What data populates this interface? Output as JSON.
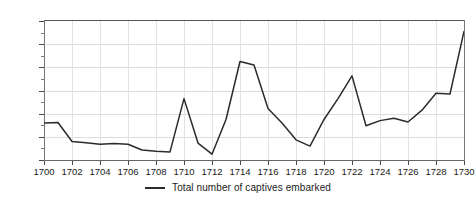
{
  "chart_data": {
    "type": "line",
    "title": "",
    "xlabel": "",
    "ylabel": "",
    "xlim": [
      1700,
      1730
    ],
    "ylim": [
      0,
      6000
    ],
    "grid": true,
    "legend_position": "bottom-center",
    "x": [
      1700,
      1701,
      1702,
      1703,
      1704,
      1705,
      1706,
      1707,
      1708,
      1709,
      1710,
      1711,
      1712,
      1713,
      1714,
      1715,
      1716,
      1717,
      1718,
      1719,
      1720,
      1721,
      1722,
      1723,
      1724,
      1725,
      1726,
      1727,
      1728,
      1729,
      1730
    ],
    "series": [
      {
        "name": "Total number of captives embarked",
        "color": "#2b2b2b",
        "values": [
          1600,
          1620,
          800,
          740,
          680,
          710,
          680,
          430,
          380,
          350,
          2650,
          730,
          250,
          1750,
          4250,
          4100,
          2220,
          1600,
          870,
          600,
          1750,
          2650,
          3630,
          1480,
          1700,
          1800,
          1640,
          2150,
          2880,
          2850,
          5550
        ]
      }
    ],
    "y_tick_labels": [
      "0",
      "1,000",
      "2,000",
      "3,000",
      "4,000",
      "5,000",
      "6,000"
    ],
    "y_tick_values": [
      0,
      1000,
      2000,
      3000,
      4000,
      5000,
      6000
    ],
    "y_minor_tick_values": [
      500,
      1500,
      2500,
      3500,
      4500,
      5500
    ],
    "x_tick_labels": [
      "1700",
      "1702",
      "1704",
      "1706",
      "1708",
      "1710",
      "1712",
      "1714",
      "1716",
      "1718",
      "1720",
      "1722",
      "1724",
      "1726",
      "1728",
      "1730"
    ],
    "x_tick_values": [
      1700,
      1702,
      1704,
      1706,
      1708,
      1710,
      1712,
      1714,
      1716,
      1718,
      1720,
      1722,
      1724,
      1726,
      1728,
      1730
    ]
  },
  "legend": {
    "entries": [
      {
        "label": "Total number of captives embarked",
        "color": "#2b2b2b"
      }
    ]
  },
  "colors": {
    "series_line": "#2b2b2b",
    "gridline": "#dcdcdc",
    "axis": "#555555",
    "text": "#1b1b1b",
    "background": "#ffffff"
  }
}
